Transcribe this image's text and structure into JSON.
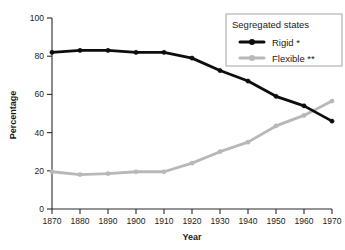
{
  "chart_data": {
    "type": "line",
    "title": "",
    "xlabel": "Year",
    "ylabel": "Percentage",
    "x": [
      1870,
      1880,
      1890,
      1900,
      1910,
      1920,
      1930,
      1940,
      1950,
      1960,
      1970
    ],
    "xtick_labels": [
      "1870",
      "1880",
      "1890",
      "1900",
      "1910",
      "1920",
      "1930",
      "1940",
      "1950",
      "1960",
      "1970"
    ],
    "ytick_labels": [
      "0",
      "20",
      "40",
      "60",
      "80",
      "100"
    ],
    "yticks": [
      0,
      20,
      40,
      60,
      80,
      100
    ],
    "xlim": [
      1870,
      1970
    ],
    "ylim": [
      0,
      100
    ],
    "grid": false,
    "legend_position": "top-right",
    "legend_title": "Segregated states",
    "series": [
      {
        "name": "Rigid *",
        "color": "#0d0d0d",
        "marker": "circle",
        "values": [
          82,
          83,
          83,
          82,
          82,
          79,
          72.5,
          67,
          59,
          54,
          46
        ]
      },
      {
        "name": "Flexible **",
        "color": "#b8b8b8",
        "marker": "circle",
        "values": [
          19.5,
          18,
          18.5,
          19.5,
          19.5,
          24,
          30,
          35,
          43.5,
          49,
          56.5
        ]
      }
    ]
  },
  "axes": {
    "x_axis_label": "Year",
    "y_axis_label": "Percentage"
  },
  "legend": {
    "title": "Segregated states",
    "entries": [
      {
        "label": "Rigid *",
        "color": "#0d0d0d"
      },
      {
        "label": "Flexible **",
        "color": "#b8b8b8"
      }
    ]
  }
}
